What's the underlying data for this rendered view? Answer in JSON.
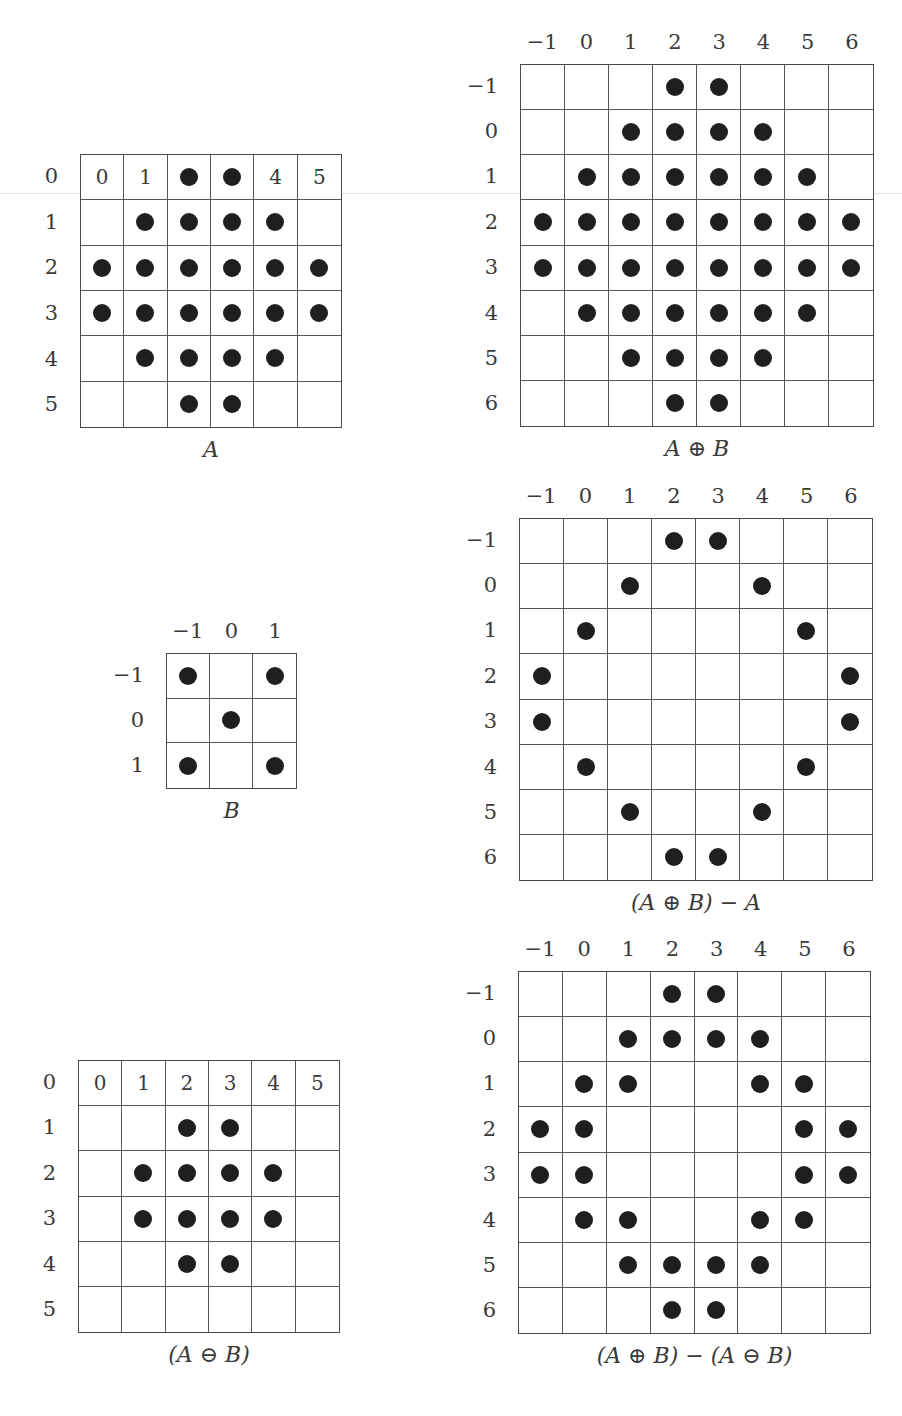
{
  "figures": [
    {
      "id": "A",
      "caption": "A",
      "cols": [
        "0",
        "1",
        "2",
        "3",
        "4",
        "5"
      ],
      "rows": [
        "0",
        "1",
        "2",
        "3",
        "4",
        "5"
      ],
      "show_col_header": false,
      "header_in_first_row": true,
      "cells": [
        [
          "0",
          "1",
          "#",
          "#",
          "4",
          "5"
        ],
        [
          ".",
          "#",
          "#",
          "#",
          "#",
          "."
        ],
        [
          "#",
          "#",
          "#",
          "#",
          "#",
          "#"
        ],
        [
          "#",
          "#",
          "#",
          "#",
          "#",
          "#"
        ],
        [
          ".",
          "#",
          "#",
          "#",
          "#",
          "."
        ],
        [
          ".",
          ".",
          "#",
          "#",
          ".",
          "."
        ]
      ],
      "box": {
        "x": 80,
        "y": 154,
        "w": 262,
        "h": 274
      }
    },
    {
      "id": "A-dilate-B",
      "caption": "A ⊕ B",
      "cols": [
        "−1",
        "0",
        "1",
        "2",
        "3",
        "4",
        "5",
        "6"
      ],
      "rows": [
        "−1",
        "0",
        "1",
        "2",
        "3",
        "4",
        "5",
        "6"
      ],
      "show_col_header": true,
      "header_in_first_row": false,
      "cells": [
        [
          ".",
          ".",
          ".",
          "#",
          "#",
          ".",
          ".",
          "."
        ],
        [
          ".",
          ".",
          "#",
          "#",
          "#",
          "#",
          ".",
          "."
        ],
        [
          ".",
          "#",
          "#",
          "#",
          "#",
          "#",
          "#",
          "."
        ],
        [
          "#",
          "#",
          "#",
          "#",
          "#",
          "#",
          "#",
          "#"
        ],
        [
          "#",
          "#",
          "#",
          "#",
          "#",
          "#",
          "#",
          "#"
        ],
        [
          ".",
          "#",
          "#",
          "#",
          "#",
          "#",
          "#",
          "."
        ],
        [
          ".",
          ".",
          "#",
          "#",
          "#",
          "#",
          ".",
          "."
        ],
        [
          ".",
          ".",
          ".",
          "#",
          "#",
          ".",
          ".",
          "."
        ]
      ],
      "box": {
        "x": 520,
        "y": 64,
        "w": 354,
        "h": 363
      }
    },
    {
      "id": "B",
      "caption": "B",
      "cols": [
        "−1",
        "0",
        "1"
      ],
      "rows": [
        "−1",
        "0",
        "1"
      ],
      "show_col_header": true,
      "header_in_first_row": false,
      "cells": [
        [
          "#",
          ".",
          "#"
        ],
        [
          ".",
          "#",
          "."
        ],
        [
          "#",
          ".",
          "#"
        ]
      ],
      "box": {
        "x": 166,
        "y": 653,
        "w": 131,
        "h": 136
      }
    },
    {
      "id": "dilate-minus-A",
      "caption": "(A ⊕ B) − A",
      "cols": [
        "−1",
        "0",
        "1",
        "2",
        "3",
        "4",
        "5",
        "6"
      ],
      "rows": [
        "−1",
        "0",
        "1",
        "2",
        "3",
        "4",
        "5",
        "6"
      ],
      "show_col_header": true,
      "header_in_first_row": false,
      "cells": [
        [
          ".",
          ".",
          ".",
          "#",
          "#",
          ".",
          ".",
          "."
        ],
        [
          ".",
          ".",
          "#",
          ".",
          ".",
          "#",
          ".",
          "."
        ],
        [
          ".",
          "#",
          ".",
          ".",
          ".",
          ".",
          "#",
          "."
        ],
        [
          "#",
          ".",
          ".",
          ".",
          ".",
          ".",
          ".",
          "#"
        ],
        [
          "#",
          ".",
          ".",
          ".",
          ".",
          ".",
          ".",
          "#"
        ],
        [
          ".",
          "#",
          ".",
          ".",
          ".",
          ".",
          "#",
          "."
        ],
        [
          ".",
          ".",
          "#",
          ".",
          ".",
          "#",
          ".",
          "."
        ],
        [
          ".",
          ".",
          ".",
          "#",
          "#",
          ".",
          ".",
          "."
        ]
      ],
      "box": {
        "x": 519,
        "y": 518,
        "w": 354,
        "h": 363
      }
    },
    {
      "id": "A-erode-B",
      "caption": "(A ⊖ B)",
      "cols": [
        "0",
        "1",
        "2",
        "3",
        "4",
        "5"
      ],
      "rows": [
        "0",
        "1",
        "2",
        "3",
        "4",
        "5"
      ],
      "show_col_header": false,
      "header_in_first_row": true,
      "cells": [
        [
          "0",
          "1",
          "2",
          "3",
          "4",
          "5"
        ],
        [
          ".",
          ".",
          "#",
          "#",
          ".",
          "."
        ],
        [
          ".",
          "#",
          "#",
          "#",
          "#",
          "."
        ],
        [
          ".",
          "#",
          "#",
          "#",
          "#",
          "."
        ],
        [
          ".",
          ".",
          "#",
          "#",
          ".",
          "."
        ],
        [
          ".",
          ".",
          ".",
          ".",
          ".",
          "."
        ]
      ],
      "box": {
        "x": 78,
        "y": 1060,
        "w": 262,
        "h": 273
      }
    },
    {
      "id": "dilate-minus-erode",
      "caption": "(A ⊕ B) − (A ⊖ B)",
      "cols": [
        "−1",
        "0",
        "1",
        "2",
        "3",
        "4",
        "5",
        "6"
      ],
      "rows": [
        "−1",
        "0",
        "1",
        "2",
        "3",
        "4",
        "5",
        "6"
      ],
      "show_col_header": true,
      "header_in_first_row": false,
      "cells": [
        [
          ".",
          ".",
          ".",
          "#",
          "#",
          ".",
          ".",
          "."
        ],
        [
          ".",
          ".",
          "#",
          "#",
          "#",
          "#",
          ".",
          "."
        ],
        [
          ".",
          "#",
          "#",
          ".",
          ".",
          "#",
          "#",
          "."
        ],
        [
          "#",
          "#",
          ".",
          ".",
          ".",
          ".",
          "#",
          "#"
        ],
        [
          "#",
          "#",
          ".",
          ".",
          ".",
          ".",
          "#",
          "#"
        ],
        [
          ".",
          "#",
          "#",
          ".",
          ".",
          "#",
          "#",
          "."
        ],
        [
          ".",
          ".",
          "#",
          "#",
          "#",
          "#",
          ".",
          "."
        ],
        [
          ".",
          ".",
          ".",
          "#",
          "#",
          ".",
          ".",
          "."
        ]
      ],
      "box": {
        "x": 518,
        "y": 971,
        "w": 353,
        "h": 363
      }
    }
  ],
  "legend": {
    "filled_cell": "#",
    "empty_cell": ".",
    "dot_color": "#1f1f1f",
    "line_color": "#4a4a4a"
  }
}
